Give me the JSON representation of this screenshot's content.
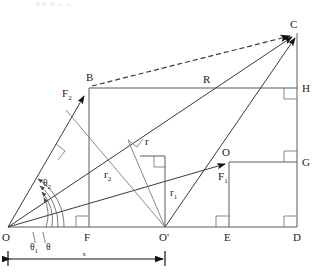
{
  "figure": {
    "type": "geometric-diagram",
    "background_color": "#ffffff",
    "line_color": "#5a5a5a",
    "label_color": "#1c1c1c"
  },
  "clipped_header_text": "θ  θ₁  θ₂  r₁  r₂",
  "points": {
    "O": {
      "label": "O",
      "x": 8,
      "y": 227
    },
    "F": {
      "label": "F",
      "x": 88,
      "y": 227
    },
    "Oprime": {
      "label": "O'",
      "x": 165,
      "y": 227
    },
    "E": {
      "label": "E",
      "x": 228,
      "y": 227
    },
    "D": {
      "label": "D",
      "x": 297,
      "y": 227
    },
    "B": {
      "label": "B",
      "x": 89,
      "y": 88
    },
    "R": {
      "label": "R",
      "x": 207,
      "y": 88
    },
    "H": {
      "label": "H",
      "x": 297,
      "y": 88
    },
    "C": {
      "label": "C",
      "x": 297,
      "y": 33
    },
    "Ocircle": {
      "label": "O",
      "x": 229,
      "y": 162
    },
    "G": {
      "label": "G",
      "x": 297,
      "y": 162
    }
  },
  "vectors": {
    "F1": {
      "label": "F",
      "subscript": "1"
    },
    "F2": {
      "label": "F",
      "subscript": "2"
    }
  },
  "radii": {
    "r": {
      "label": "r"
    },
    "r1": {
      "label": "r",
      "subscript": "1"
    },
    "r2": {
      "label": "r",
      "subscript": "2"
    }
  },
  "angles": {
    "theta": {
      "label": "θ"
    },
    "theta1": {
      "label": "θ",
      "subscript": "1"
    },
    "theta2": {
      "label": "θ",
      "subscript": "2"
    }
  },
  "dimension": {
    "label": "x",
    "from_x": 8,
    "to_x": 165,
    "y": 258
  },
  "resultant": {
    "label": "R"
  }
}
